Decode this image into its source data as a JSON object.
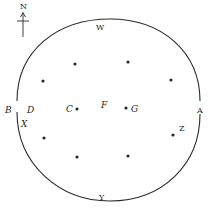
{
  "diagram": {
    "compass": {
      "label": "N"
    },
    "labels": {
      "W": "W",
      "Y": "Y",
      "A": "A",
      "B": "B",
      "D": "D",
      "X": "X",
      "Z": "Z",
      "C": "C",
      "F": "F",
      "G": "G"
    },
    "points": [
      {
        "x": 75,
        "y": 64
      },
      {
        "x": 128,
        "y": 62
      },
      {
        "x": 43,
        "y": 81
      },
      {
        "x": 171,
        "y": 80
      },
      {
        "x": 77,
        "y": 109
      },
      {
        "x": 126,
        "y": 108
      },
      {
        "x": 44,
        "y": 138
      },
      {
        "x": 173,
        "y": 135
      },
      {
        "x": 77,
        "y": 157
      },
      {
        "x": 128,
        "y": 156
      }
    ],
    "colors": {
      "stroke": "#2a2a2a",
      "background": "#ffffff"
    }
  }
}
